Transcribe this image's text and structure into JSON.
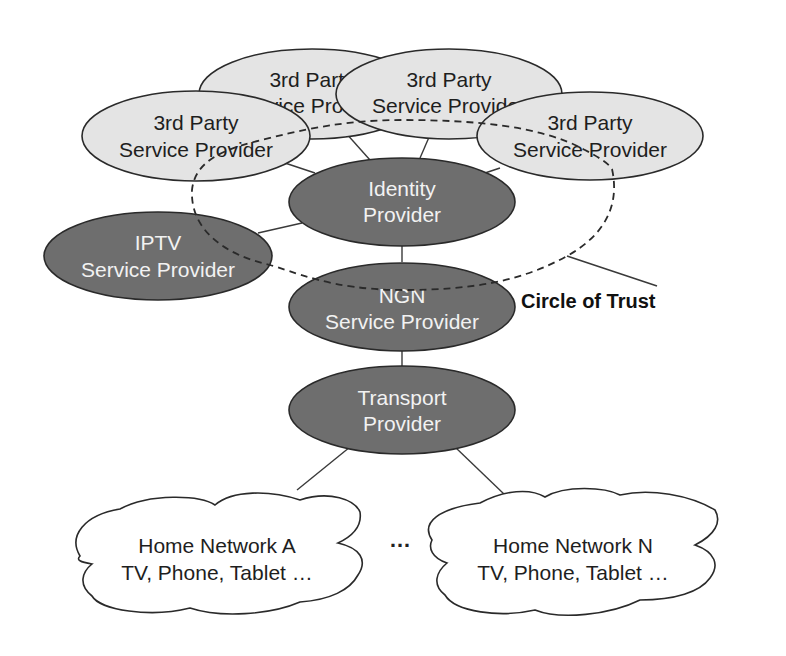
{
  "diagram": {
    "title": "",
    "nodes": {
      "tp_back_left": {
        "line1": "3rd Party",
        "line2": "Service Provider",
        "style": "light"
      },
      "tp_back_right": {
        "line1": "3rd Party",
        "line2": "Service Provider",
        "style": "light"
      },
      "tp_left": {
        "line1": "3rd Party",
        "line2": "Service Provider",
        "style": "light"
      },
      "tp_right": {
        "line1": "3rd Party",
        "line2": "Service Provider",
        "style": "light"
      },
      "identity": {
        "line1": "Identity",
        "line2": "Provider",
        "style": "dark"
      },
      "iptv": {
        "line1": "IPTV",
        "line2": "Service Provider",
        "style": "dark"
      },
      "ngn": {
        "line1": "NGN",
        "line2": "Service Provider",
        "style": "dark"
      },
      "transport": {
        "line1": "Transport",
        "line2": "Provider",
        "style": "dark"
      },
      "home_a": {
        "line1": "Home Network A",
        "line2": "TV, Phone, Tablet …",
        "style": "cloud"
      },
      "home_n": {
        "line1": "Home Network N",
        "line2": "TV, Phone, Tablet …",
        "style": "cloud"
      }
    },
    "edges": [
      [
        "tp_back_left",
        "identity"
      ],
      [
        "tp_back_right",
        "identity"
      ],
      [
        "tp_left",
        "identity"
      ],
      [
        "tp_right",
        "identity"
      ],
      [
        "iptv",
        "identity"
      ],
      [
        "identity",
        "ngn"
      ],
      [
        "ngn",
        "transport"
      ],
      [
        "transport",
        "home_a"
      ],
      [
        "transport",
        "home_n"
      ]
    ],
    "circle_of_trust_label": "Circle of Trust",
    "ellipsis": "…"
  }
}
